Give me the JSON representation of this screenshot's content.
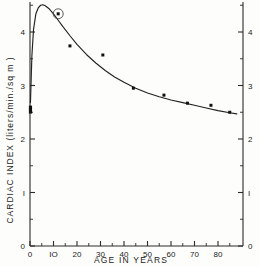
{
  "chart_data": {
    "type": "scatter",
    "title": "",
    "subtitle": "",
    "xlabel": "AGE  IN  YEARS",
    "ylabel": "CARDIAC  INDEX  (liters/min./sq m )",
    "ylabel_right": "",
    "xlim": [
      0,
      88
    ],
    "ylim": [
      0,
      4.8
    ],
    "x_ticks": [
      0,
      10,
      20,
      30,
      40,
      50,
      60,
      70,
      80
    ],
    "x_tick_labels": [
      "0",
      "IO",
      "20",
      "30",
      "40",
      "50",
      "60",
      "70",
      "80"
    ],
    "x_minor_ticks": [
      5,
      15,
      25,
      35,
      45,
      55,
      65,
      75,
      85
    ],
    "y_ticks": [
      0,
      1,
      2,
      3,
      4
    ],
    "y_tick_labels": [
      "0",
      "I",
      "2",
      "3",
      "4"
    ],
    "y_tick_labels_right": [
      "0",
      "I",
      "2",
      "3",
      "4"
    ],
    "y_minor_ticks": [
      0.5,
      1.5,
      2.5,
      3.5,
      4.5
    ],
    "grid": false,
    "legend": false,
    "legend_position": "none",
    "axis_color": "#2a2a2a",
    "curve_color": "#222222",
    "point_color": "#111111",
    "background_color": "#fdfdfb",
    "points": [
      {
        "x": 12,
        "y": 4.34,
        "highlighted": true,
        "marker": "circled-dot"
      },
      {
        "x": 17,
        "y": 3.74,
        "highlighted": false,
        "marker": "dot"
      },
      {
        "x": 31,
        "y": 3.57,
        "highlighted": false,
        "marker": "dot"
      },
      {
        "x": 44,
        "y": 2.95,
        "highlighted": false,
        "marker": "dot"
      },
      {
        "x": 57,
        "y": 2.82,
        "highlighted": false,
        "marker": "dot"
      },
      {
        "x": 67,
        "y": 2.67,
        "highlighted": false,
        "marker": "dot"
      },
      {
        "x": 77,
        "y": 2.63,
        "highlighted": false,
        "marker": "dot"
      },
      {
        "x": 85,
        "y": 2.5,
        "highlighted": false,
        "marker": "dot"
      }
    ],
    "series": [
      {
        "name": "fitted curve",
        "x": [
          0.2,
          0.8,
          1.5,
          2.5,
          3.5,
          4.5,
          5.5,
          6.5,
          8,
          10,
          12,
          14,
          17,
          20,
          24,
          28,
          32,
          36,
          40,
          45,
          50,
          55,
          60,
          65,
          70,
          75,
          80,
          85,
          88
        ],
        "values": [
          2.68,
          3.55,
          4.05,
          4.34,
          4.45,
          4.5,
          4.51,
          4.49,
          4.44,
          4.34,
          4.22,
          4.1,
          3.93,
          3.77,
          3.58,
          3.42,
          3.28,
          3.16,
          3.06,
          2.95,
          2.86,
          2.79,
          2.73,
          2.68,
          2.63,
          2.58,
          2.53,
          2.49,
          2.47
        ]
      }
    ],
    "curve_origin": {
      "x": 0.2,
      "y": 2.68
    },
    "origin_marker": {
      "x": 0.2,
      "y": 2.55,
      "marker": "bold-tick"
    },
    "peak": {
      "x": 5.7,
      "y": 4.51
    }
  },
  "figure": {
    "frame_border": false,
    "left_axis_visible": true,
    "right_axis_visible": true,
    "bottom_axis_visible": true,
    "top_axis_visible": false
  }
}
